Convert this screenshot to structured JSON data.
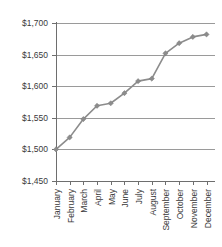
{
  "chart_data": {
    "type": "line",
    "title": "",
    "subtitle": "",
    "xlabel": "",
    "ylabel": "",
    "categories": [
      "January",
      "February",
      "March",
      "April",
      "May",
      "June",
      "July",
      "August",
      "September",
      "October",
      "November",
      "December"
    ],
    "values": [
      1500,
      1519,
      1548,
      1569,
      1573,
      1589,
      1608,
      1612,
      1652,
      1668,
      1678,
      1682
    ],
    "series": [
      {
        "name": "",
        "values": [
          1500,
          1519,
          1548,
          1569,
          1573,
          1589,
          1608,
          1612,
          1652,
          1668,
          1678,
          1682
        ]
      }
    ],
    "ylim": [
      1450,
      1700
    ],
    "yticks": [
      1450,
      1500,
      1550,
      1600,
      1650,
      1700
    ],
    "ytick_labels": [
      "$1,450",
      "$1,500",
      "$1,550",
      "$1,600",
      "$1,650",
      "$1,700"
    ],
    "grid": true,
    "grid_axis": "y",
    "legend": false,
    "legend_position": "none",
    "marker": "diamond",
    "line_color": "#8c8c8c",
    "marker_color": "#8c8c8c",
    "grid_color": "#9a9a9a",
    "axis_color": "#6e6e6e",
    "background_color": "#ffffff",
    "text_color": "#3a3a3a"
  }
}
